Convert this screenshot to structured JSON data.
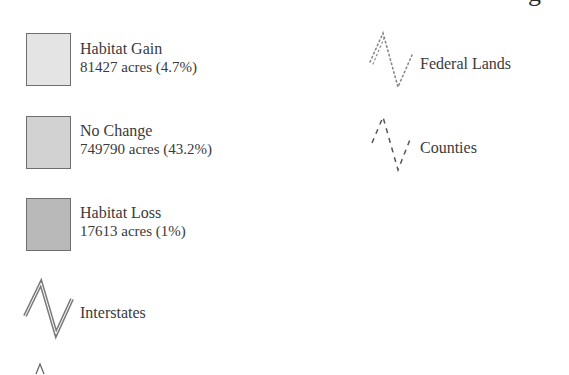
{
  "legend": {
    "title_fragment": "g",
    "area_classes": [
      {
        "name": "Habitat Gain",
        "stat": "81427 acres (4.7%)",
        "acres": 81427,
        "percent": 4.7,
        "fill": "#e4e4e4",
        "border": "#6e6e6e"
      },
      {
        "name": "No Change",
        "stat": "749790 acres (43.2%)",
        "acres": 749790,
        "percent": 43.2,
        "fill": "#d2d2d2",
        "border": "#6e6e6e"
      },
      {
        "name": "Habitat Loss",
        "stat": "17613 acres (1%)",
        "acres": 17613,
        "percent": 1,
        "fill": "#b9b9b9",
        "border": "#6e6e6e"
      }
    ],
    "line_features": [
      {
        "name": "Interstates",
        "style": "double-solid",
        "color": "#777777"
      },
      {
        "name": "Federal Lands",
        "style": "dotted",
        "color": "#8a8a8a"
      },
      {
        "name": "Counties",
        "style": "dashed",
        "color": "#555555"
      }
    ],
    "partial_symbol": "^"
  }
}
